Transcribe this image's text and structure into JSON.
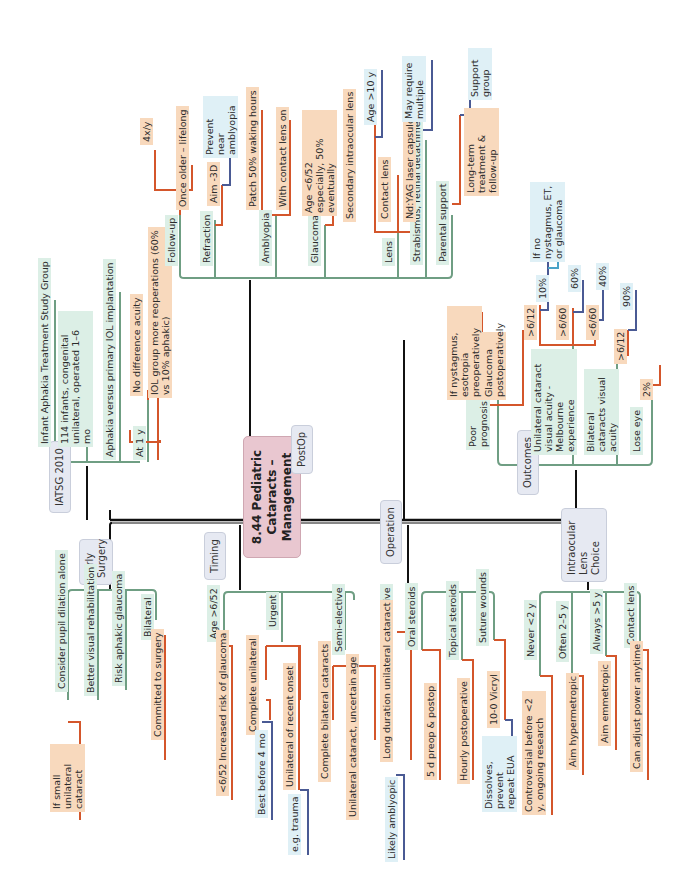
{
  "center": {
    "line1": "8.44 Pediatric",
    "line2": "Cataracts – Management"
  },
  "colors": {
    "green": "#6f9e83",
    "orange": "#d4562b",
    "blue": "#4a5a94",
    "lightblue": "#4aa3c8",
    "black": "#111111"
  },
  "branches": {
    "early_surgery": {
      "title": "Early Surgery",
      "items": [
        "Consider pupil dilation alone",
        "Better visual rehabilitation",
        "Risk aphakic glaucoma",
        "Bilateral"
      ],
      "sub": {
        "consider": "If small unilateral cataract",
        "bilateral": "Committed to surgery"
      }
    },
    "timing": {
      "title": "Timing",
      "items": [
        "Age >6/52",
        "Urgent",
        "Semi-elective",
        "Elective"
      ],
      "age_sub": [
        "<6/52 Increased risk of glaucoma"
      ],
      "urgent_sub": [
        "Complete unilateral",
        "Unilateral of recent onset"
      ],
      "complete_unilateral_sub": "Best before 4 mo",
      "recent_onset_sub": "e.g. trauma",
      "semi_sub": [
        "Complete bilateral cataracts",
        "Unilateral cataract, uncertain age"
      ],
      "elective_sub": "Long duration unilateral cataract",
      "long_duration_sub": "Likely amblyopic"
    },
    "operation": {
      "title": "Operation",
      "items": [
        "Oral steroids",
        "Topical steroids",
        "Suture wounds"
      ],
      "oral_sub": "5 d preop & postop",
      "topical_sub": "Hourly postoperative",
      "suture_sub": "10-0 Vicryl",
      "vicryl_sub": "Dissolves, prevent repeat EUA"
    },
    "iol": {
      "title": "Intraocular Lens Choice",
      "items": [
        "Never <2 y",
        "Often 2–5 y",
        "Always >5 y",
        "Contact lens"
      ],
      "never_sub": "Controversial before <2 y, ongoing research",
      "often_sub": "Aim hypermetropic",
      "always_sub": "Aim emmetropic",
      "contact_sub": "Can adjust power anytime"
    },
    "iatsg": {
      "title": "IATSG 2010",
      "items": [
        "Infant Aphakia Treatment Study Group",
        "114 infants, congenital unilateral, operated 1–6 mo",
        "Aphakia versus primary IOL implantation",
        "At 1 y"
      ],
      "at1y_sub": [
        "No difference acuity",
        "IOL group more reoperations (60% vs 10% aphakic)"
      ]
    },
    "postop": {
      "title": "PostOp",
      "items": [
        "Follow-up",
        "Refraction",
        "Amblyopia",
        "Glaucoma",
        "Lens",
        "Strabismus, retinal detachment",
        "Parental support"
      ],
      "followup_sub": [
        "4x/y",
        "Once older – lifelong"
      ],
      "refraction_sub": "Aim -3D",
      "aim_sub": "Prevent near amblyopia",
      "amblyopia_sub": [
        "Patch 50% waking hours",
        "With contact lens on"
      ],
      "glaucoma_sub": "Age <6/52 especially, 50% eventually",
      "lens_sub": [
        "Secondary intraocular lens",
        "Contact lens",
        "Nd:YAG laser capsulotomy"
      ],
      "secondary_sub": "Age >10 y",
      "yag_sub": "May require multiple",
      "parental_sub": "Long-term treatment & follow-up",
      "longterm_sub": "Support group"
    },
    "outcomes": {
      "title": "Outcomes",
      "items": [
        "Poor prognosis",
        "Unilateral cataract visual acuity - Melbourne experience",
        "Bilateral cataracts visual acuity",
        "Lose eye"
      ],
      "poor_sub": [
        "If nystagmus, esotropia preoperatively",
        "Glaucoma postoperatively"
      ],
      "unilateral_sub": [
        ">6/12",
        ">6/60",
        "<6/60"
      ],
      "unilateral_pct": [
        "10%",
        "60%",
        "40%"
      ],
      "ten_sub": "If no nystagmus, ET, or glaucoma",
      "bilateral_sub": ">6/12",
      "bilateral_pct": "90%",
      "lose_sub": "2%"
    }
  }
}
